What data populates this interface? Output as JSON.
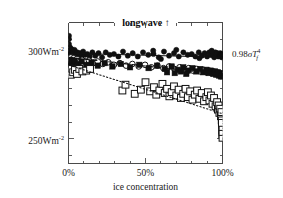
{
  "figure": {
    "title": "longwave ↑",
    "title_arrow": "↑",
    "background_color": "#ffffff",
    "frame_color": "#4a4a4a"
  },
  "axes": {
    "x": {
      "label": "ice concentration",
      "tick_labels": [
        "0%",
        "50%",
        "100%"
      ],
      "tick_values": [
        0,
        50,
        100
      ],
      "minor_tick_step": 10,
      "range": [
        0,
        100
      ]
    },
    "y": {
      "tick_labels": [
        "300Wm-2",
        "250Wm-2"
      ],
      "tick_label_300_main": "300Wm",
      "tick_label_300_sup": "-2",
      "tick_label_250_main": "250Wm",
      "tick_label_250_sup": "-2",
      "tick_values": [
        300,
        250
      ],
      "minor_tick_step": 10,
      "range": [
        235,
        320
      ]
    }
  },
  "annotations": {
    "stefan_boltzmann": {
      "coefficient": "0.98",
      "sigma": "σ",
      "symbol": "T",
      "subscript": "f",
      "superscript": "4"
    }
  },
  "chart_data": {
    "type": "scatter",
    "title": "longwave ↑",
    "xlabel": "ice concentration",
    "ylabel": "",
    "xlim": [
      0,
      100
    ],
    "ylim": [
      235,
      320
    ],
    "xticks": [
      0,
      50,
      100
    ],
    "xticklabels": [
      "0%",
      "50%",
      "100%"
    ],
    "yticks": [
      250,
      300
    ],
    "yticklabels": [
      "250Wm-2",
      "300Wm-2"
    ],
    "grid": false,
    "legend": "none",
    "units": "W m-2",
    "series": [
      {
        "name": "upward longwave (filled circles)",
        "marker": "filled-circle",
        "color": "#101010",
        "trend": {
          "style": "solid",
          "x": [
            0,
            100
          ],
          "y": [
            301.5,
            299.0
          ]
        },
        "points": [
          [
            0.4,
            299.5
          ],
          [
            0.6,
            303.0
          ],
          [
            0.8,
            301.0
          ],
          [
            1.0,
            305.0
          ],
          [
            1.2,
            300.5
          ],
          [
            1.5,
            302.0
          ],
          [
            1.8,
            298.5
          ],
          [
            2.0,
            304.0
          ],
          [
            2.3,
            301.5
          ],
          [
            2.6,
            300.0
          ],
          [
            3.0,
            302.5
          ],
          [
            3.4,
            299.0
          ],
          [
            3.9,
            303.5
          ],
          [
            4.4,
            301.0
          ],
          [
            5.0,
            300.5
          ],
          [
            5.7,
            302.0
          ],
          [
            6.5,
            299.5
          ],
          [
            7.4,
            301.5
          ],
          [
            8.4,
            300.0
          ],
          [
            9.5,
            302.5
          ],
          [
            10.8,
            300.5
          ],
          [
            12.2,
            301.0
          ],
          [
            13.8,
            299.5
          ],
          [
            15.5,
            302.0
          ],
          [
            17.4,
            300.0
          ],
          [
            19.5,
            301.5
          ],
          [
            21.8,
            299.0
          ],
          [
            24.2,
            302.0
          ],
          [
            26.8,
            300.5
          ],
          [
            29.5,
            301.0
          ],
          [
            32.4,
            299.5
          ],
          [
            35.4,
            302.5
          ],
          [
            38.5,
            300.0
          ],
          [
            41.7,
            301.5
          ],
          [
            45.0,
            299.5
          ],
          [
            48.4,
            302.0
          ],
          [
            51.8,
            300.5
          ],
          [
            55.2,
            301.0
          ],
          [
            58.6,
            299.0
          ],
          [
            62.0,
            302.5
          ],
          [
            65.3,
            300.0
          ],
          [
            68.5,
            301.5
          ],
          [
            71.6,
            299.5
          ],
          [
            74.6,
            302.0
          ],
          [
            77.4,
            300.5
          ],
          [
            80.0,
            301.0
          ],
          [
            82.4,
            299.5
          ],
          [
            84.6,
            302.0
          ],
          [
            86.6,
            300.0
          ],
          [
            88.4,
            301.5
          ],
          [
            90.0,
            299.5
          ],
          [
            91.4,
            302.0
          ],
          [
            92.6,
            300.5
          ],
          [
            93.7,
            301.0
          ],
          [
            94.6,
            299.0
          ],
          [
            95.4,
            302.0
          ],
          [
            96.1,
            300.5
          ],
          [
            96.7,
            301.5
          ],
          [
            97.2,
            299.5
          ],
          [
            97.7,
            301.0
          ],
          [
            98.1,
            300.0
          ],
          [
            98.5,
            301.5
          ],
          [
            98.8,
            299.5
          ],
          [
            99.1,
            300.5
          ],
          [
            99.4,
            301.0
          ],
          [
            99.6,
            299.0
          ],
          [
            99.8,
            300.0
          ],
          [
            99.9,
            301.0
          ],
          [
            100.0,
            299.5
          ],
          [
            100.0,
            300.5
          ],
          [
            0.3,
            307.0
          ],
          [
            0.3,
            310.0
          ],
          [
            0.3,
            312.0
          ],
          [
            0.4,
            296.0
          ],
          [
            0.5,
            294.0
          ],
          [
            55.0,
            303.0
          ],
          [
            60.0,
            298.0
          ],
          [
            70.0,
            303.5
          ],
          [
            85.0,
            298.5
          ],
          [
            93.0,
            303.0
          ]
        ]
      },
      {
        "name": "open circles series",
        "marker": "open-circle",
        "color": "#101010",
        "trend": {
          "style": "dashed",
          "x": [
            0,
            100
          ],
          "y": [
            299.0,
            288.5
          ]
        },
        "points": [
          [
            0.5,
            298.0
          ],
          [
            1.0,
            297.0
          ],
          [
            1.6,
            299.0
          ],
          [
            2.3,
            296.5
          ],
          [
            3.2,
            298.5
          ],
          [
            4.2,
            297.0
          ],
          [
            5.5,
            298.0
          ],
          [
            7.0,
            296.0
          ],
          [
            8.8,
            297.5
          ],
          [
            10.9,
            296.5
          ],
          [
            13.3,
            297.0
          ],
          [
            16.0,
            295.5
          ],
          [
            19.0,
            296.5
          ],
          [
            22.3,
            295.0
          ],
          [
            25.8,
            296.0
          ],
          [
            29.5,
            294.5
          ],
          [
            33.4,
            295.5
          ],
          [
            37.4,
            294.0
          ],
          [
            41.5,
            295.0
          ],
          [
            45.6,
            293.5
          ],
          [
            49.7,
            294.5
          ],
          [
            53.8,
            293.0
          ],
          [
            57.8,
            294.0
          ],
          [
            61.6,
            292.5
          ],
          [
            65.3,
            293.5
          ],
          [
            68.8,
            292.0
          ],
          [
            72.1,
            293.0
          ],
          [
            75.2,
            291.5
          ],
          [
            78.1,
            292.5
          ],
          [
            80.8,
            291.0
          ],
          [
            83.3,
            292.0
          ],
          [
            85.6,
            290.5
          ],
          [
            87.7,
            291.5
          ],
          [
            89.6,
            290.0
          ],
          [
            91.3,
            291.0
          ],
          [
            92.8,
            289.5
          ],
          [
            94.2,
            290.5
          ],
          [
            95.4,
            289.0
          ],
          [
            96.4,
            290.0
          ],
          [
            97.3,
            288.5
          ],
          [
            98.1,
            289.5
          ],
          [
            98.8,
            288.0
          ],
          [
            99.3,
            289.0
          ],
          [
            99.7,
            288.5
          ],
          [
            100.0,
            289.0
          ]
        ]
      },
      {
        "name": "filled squares series",
        "marker": "filled-square",
        "color": "#101010",
        "trend": {
          "style": "dashed",
          "x": [
            0,
            100
          ],
          "y": [
            299.0,
            288.5
          ]
        },
        "points": [
          [
            0.6,
            296.0
          ],
          [
            1.4,
            297.5
          ],
          [
            2.5,
            295.5
          ],
          [
            4.0,
            297.0
          ],
          [
            6.0,
            295.0
          ],
          [
            8.5,
            296.5
          ],
          [
            11.5,
            294.5
          ],
          [
            15.0,
            296.0
          ],
          [
            19.0,
            294.0
          ],
          [
            23.5,
            295.5
          ],
          [
            28.5,
            293.5
          ],
          [
            34.0,
            295.0
          ],
          [
            40.0,
            293.0
          ],
          [
            46.0,
            294.5
          ],
          [
            52.0,
            292.5
          ],
          [
            57.5,
            294.0
          ],
          [
            62.5,
            292.0
          ],
          [
            67.0,
            293.5
          ],
          [
            71.0,
            291.5
          ],
          [
            74.5,
            293.0
          ],
          [
            77.5,
            291.0
          ],
          [
            80.5,
            292.5
          ],
          [
            83.0,
            290.5
          ],
          [
            85.5,
            292.0
          ],
          [
            87.5,
            290.0
          ],
          [
            89.5,
            291.5
          ],
          [
            91.0,
            289.5
          ],
          [
            92.5,
            291.0
          ],
          [
            94.0,
            289.0
          ],
          [
            95.0,
            290.5
          ],
          [
            96.0,
            288.5
          ],
          [
            97.0,
            290.0
          ],
          [
            97.8,
            288.0
          ],
          [
            98.5,
            289.5
          ],
          [
            99.0,
            287.5
          ],
          [
            99.5,
            289.0
          ],
          [
            99.8,
            288.0
          ],
          [
            100.0,
            287.5
          ],
          [
            64.0,
            290.0
          ],
          [
            69.0,
            289.5
          ],
          [
            73.0,
            290.5
          ],
          [
            76.5,
            289.0
          ]
        ]
      },
      {
        "name": "open squares series",
        "marker": "open-square",
        "color": "#101010",
        "trend": {
          "style": "dotted",
          "x": [
            3,
            100
          ],
          "y": [
            293.5,
            265.0
          ]
        },
        "points": [
          [
            1.0,
            291.0
          ],
          [
            1.5,
            288.5
          ],
          [
            2.2,
            292.0
          ],
          [
            3.0,
            290.0
          ],
          [
            4.2,
            291.5
          ],
          [
            5.5,
            289.0
          ],
          [
            7.0,
            292.0
          ],
          [
            9.0,
            290.5
          ],
          [
            11.5,
            291.0
          ],
          [
            14.0,
            292.0
          ],
          [
            35.0,
            279.0
          ],
          [
            37.0,
            282.5
          ],
          [
            43.0,
            277.0
          ],
          [
            47.0,
            279.5
          ],
          [
            50.0,
            284.0
          ],
          [
            53.0,
            278.5
          ],
          [
            55.5,
            281.0
          ],
          [
            57.0,
            276.5
          ],
          [
            59.0,
            279.0
          ],
          [
            61.0,
            283.0
          ],
          [
            62.5,
            277.5
          ],
          [
            64.0,
            280.0
          ],
          [
            65.5,
            275.5
          ],
          [
            67.0,
            278.0
          ],
          [
            68.5,
            281.5
          ],
          [
            70.0,
            276.0
          ],
          [
            71.5,
            279.5
          ],
          [
            73.0,
            274.5
          ],
          [
            74.5,
            277.0
          ],
          [
            76.0,
            280.0
          ],
          [
            77.5,
            275.0
          ],
          [
            79.0,
            278.5
          ],
          [
            80.5,
            273.5
          ],
          [
            82.0,
            276.5
          ],
          [
            83.5,
            279.0
          ],
          [
            85.0,
            274.0
          ],
          [
            86.5,
            277.5
          ],
          [
            88.0,
            272.5
          ],
          [
            89.5,
            275.0
          ],
          [
            90.5,
            278.0
          ],
          [
            91.5,
            273.0
          ],
          [
            92.5,
            276.0
          ],
          [
            93.5,
            271.0
          ],
          [
            94.5,
            274.5
          ],
          [
            95.5,
            269.5
          ],
          [
            96.5,
            272.0
          ],
          [
            97.0,
            267.5
          ],
          [
            97.5,
            270.0
          ],
          [
            98.0,
            265.5
          ],
          [
            98.5,
            268.0
          ],
          [
            99.0,
            263.5
          ],
          [
            99.3,
            266.0
          ],
          [
            99.5,
            261.0
          ],
          [
            99.7,
            258.5
          ],
          [
            99.8,
            255.0
          ],
          [
            99.9,
            252.5
          ],
          [
            100.0,
            250.5
          ],
          [
            100.0,
            254.0
          ],
          [
            100.0,
            257.0
          ],
          [
            99.6,
            259.5
          ]
        ]
      }
    ]
  }
}
